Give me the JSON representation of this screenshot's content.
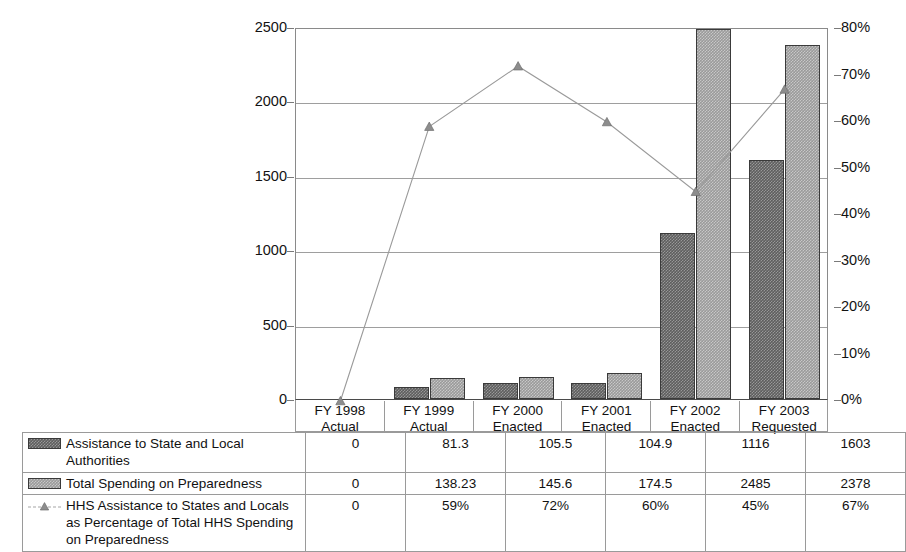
{
  "chart_data": {
    "type": "bar",
    "title": "",
    "subtitle": "",
    "xlabel": "",
    "ylabel": "",
    "categories": [
      "FY 1998\nActual",
      "FY 1999\nActual",
      "FY 2000\nEnacted",
      "FY 2001\nEnacted",
      "FY 2002\nEnacted",
      "FY 2003\nRequested"
    ],
    "category_lines": [
      [
        "FY 1998",
        "Actual"
      ],
      [
        "FY 1999",
        "Actual"
      ],
      [
        "FY 2000",
        "Enacted"
      ],
      [
        "FY 2001",
        "Enacted"
      ],
      [
        "FY 2002",
        "Enacted"
      ],
      [
        "FY 2003",
        "Requested"
      ]
    ],
    "series": [
      {
        "name": "Assistance to State and Local Authorities",
        "type": "bar",
        "axis": "left",
        "color": "#5e5e5e",
        "values": [
          0,
          81.3,
          105.5,
          104.9,
          1116,
          1603
        ],
        "display_values": [
          "0",
          "81.3",
          "105.5",
          "104.9",
          "1116",
          "1603"
        ]
      },
      {
        "name": "Total Spending on Preparedness",
        "type": "bar",
        "axis": "left",
        "color": "#9a9a9a",
        "values": [
          0,
          138.23,
          145.6,
          174.5,
          2485,
          2378
        ],
        "display_values": [
          "0",
          "138.23",
          "145.6",
          "174.5",
          "2485",
          "2378"
        ]
      },
      {
        "name": "HHS Assistance to States and Locals as Percentage of Total HHS Spending on Preparedness",
        "type": "line",
        "axis": "right",
        "color": "#9a9a9a",
        "marker": "triangle",
        "values": [
          0,
          59,
          72,
          60,
          45,
          67
        ],
        "display_values": [
          "0",
          "59%",
          "72%",
          "60%",
          "45%",
          "67%"
        ]
      }
    ],
    "left_axis": {
      "ticks": [
        0,
        500,
        1000,
        1500,
        2000,
        2500
      ],
      "tick_labels": [
        "0",
        "500",
        "1000",
        "1500",
        "2000",
        "2500"
      ],
      "ylim": [
        0,
        2500
      ]
    },
    "right_axis": {
      "ticks": [
        0,
        10,
        20,
        30,
        40,
        50,
        60,
        70,
        80
      ],
      "tick_labels": [
        "0%",
        "10%",
        "20%",
        "30%",
        "40%",
        "50%",
        "60%",
        "70%",
        "80%"
      ],
      "ylim": [
        0,
        80
      ]
    },
    "grid": true,
    "legend_position": "table-below"
  },
  "table": {
    "rows": [
      {
        "marker": "swatch-dark",
        "label": "Assistance to State and Local Authorities",
        "values": [
          "0",
          "81.3",
          "105.5",
          "104.9",
          "1116",
          "1603"
        ]
      },
      {
        "marker": "swatch-light",
        "label": "Total Spending on Preparedness",
        "values": [
          "0",
          "138.23",
          "145.6",
          "174.5",
          "2485",
          "2378"
        ]
      },
      {
        "marker": "line-triangle",
        "label": "HHS Assistance to States and Locals as Percentage of Total HHS Spending on Preparedness",
        "values": [
          "0",
          "59%",
          "72%",
          "60%",
          "45%",
          "67%"
        ]
      }
    ]
  }
}
